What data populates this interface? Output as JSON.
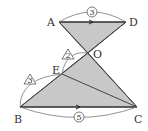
{
  "diagram": {
    "points": {
      "A": {
        "label": "A",
        "x": 59,
        "y": 22
      },
      "D": {
        "label": "D",
        "x": 126,
        "y": 22
      },
      "O": {
        "label": "O",
        "x": 88,
        "y": 53
      },
      "E": {
        "label": "E",
        "x": 62,
        "y": 74
      },
      "B": {
        "label": "B",
        "x": 20,
        "y": 107
      },
      "C": {
        "label": "C",
        "x": 137,
        "y": 107
      }
    },
    "ratios": {
      "AD": "3",
      "BC": "5",
      "EO": "2",
      "BE": "3"
    },
    "colors": {
      "fill": "#c8c8c8",
      "stroke": "#444444"
    }
  }
}
